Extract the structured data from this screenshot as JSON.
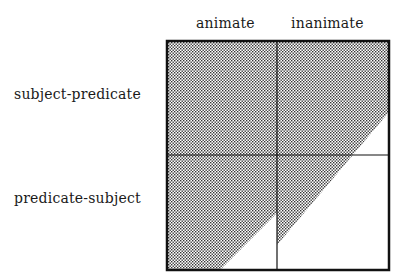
{
  "diagram": {
    "columns": [
      {
        "label": "animate"
      },
      {
        "label": "inanimate"
      }
    ],
    "rows": [
      {
        "label": "subject-predicate"
      },
      {
        "label": "predicate-subject"
      }
    ],
    "shading": "dotted region bounded by a diagonal line crossing all four cells; nearly full in top-left, partial in others",
    "colors": {
      "line": "#111111",
      "dots": "#333333",
      "background": "#ffffff"
    }
  }
}
